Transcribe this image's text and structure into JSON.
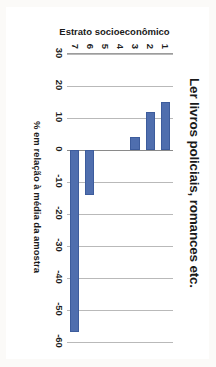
{
  "chart_data": {
    "type": "bar",
    "title": "Ler livros policiais, romances etc.",
    "xlabel": "Estrato socioeconômico",
    "ylabel": "% em relação à média da amostra",
    "orientation": "vertical",
    "categories": [
      "1",
      "2",
      "3",
      "4",
      "5",
      "6",
      "7"
    ],
    "values": [
      15,
      12,
      4,
      0,
      0,
      -14,
      -57
    ],
    "ylim": [
      -60,
      30
    ],
    "yticks": [
      30,
      20,
      10,
      0,
      -10,
      -20,
      -30,
      -40,
      -50,
      -60
    ],
    "ytick_labels": [
      "30",
      "20",
      "10",
      "0",
      "-10",
      "-20",
      "-30",
      "-40",
      "-50",
      "-60"
    ],
    "grid": "vertical-major",
    "legend": "none",
    "series": [
      {
        "name": "% em relação à média da amostra",
        "color": "#4F6EAE",
        "values": [
          15,
          12,
          4,
          0,
          0,
          -14,
          -57
        ]
      }
    ],
    "annotations": []
  },
  "figure": {
    "plot_background": "#FFFFFF",
    "gridline_color": "#B9B9B9",
    "axis_color": "#9C9C9C",
    "bar_color": "#4F6EAE",
    "bar_border_color": "#3D5C9C",
    "page_background": "#FBFAF8",
    "rotation_degrees": 90
  }
}
